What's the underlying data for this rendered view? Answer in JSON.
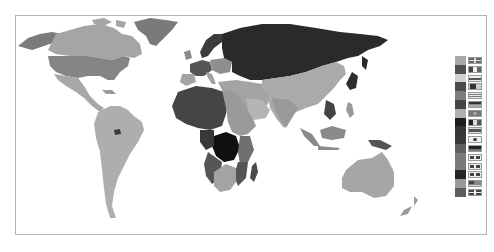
{
  "map": {
    "type": "world-choropleth",
    "palette": "grayscale",
    "regions": [
      {
        "name": "alaska",
        "shade": "#7b7b7b"
      },
      {
        "name": "canada",
        "shade": "#a5a5a5"
      },
      {
        "name": "greenland",
        "shade": "#7a7a7a"
      },
      {
        "name": "usa",
        "shade": "#858585"
      },
      {
        "name": "mexico-central-america",
        "shade": "#a8a8a8"
      },
      {
        "name": "south-america",
        "shade": "#aeaeae"
      },
      {
        "name": "french-guiana",
        "shade": "#3a3a3a"
      },
      {
        "name": "russia",
        "shade": "#2a2a2a"
      },
      {
        "name": "scandinavia",
        "shade": "#3c3c3c"
      },
      {
        "name": "western-europe",
        "shade": "#555555"
      },
      {
        "name": "central-europe",
        "shade": "#8f8f8f"
      },
      {
        "name": "middle-east",
        "shade": "#a4a4a4"
      },
      {
        "name": "west-africa",
        "shade": "#454545"
      },
      {
        "name": "north-east-africa",
        "shade": "#9a9a9a"
      },
      {
        "name": "central-africa",
        "shade": "#101010"
      },
      {
        "name": "southern-africa",
        "shade": "#a3a3a3"
      },
      {
        "name": "angola-mozambique",
        "shade": "#555555"
      },
      {
        "name": "madagascar",
        "shade": "#4a4a4a"
      },
      {
        "name": "asia",
        "shade": "#aaaaaa"
      },
      {
        "name": "indochina",
        "shade": "#444444"
      },
      {
        "name": "indonesia",
        "shade": "#8a8a8a"
      },
      {
        "name": "new-guinea",
        "shade": "#555555"
      },
      {
        "name": "australia",
        "shade": "#a6a6a6"
      },
      {
        "name": "new-zealand",
        "shade": "#9a9a9a"
      }
    ]
  },
  "legend": {
    "items": [
      {
        "swatch": "#a8a8a8",
        "flag": "uk-flag"
      },
      {
        "swatch": "#505050",
        "flag": "vertical-tricolor-flag"
      },
      {
        "swatch": "#d2d2d2",
        "flag": "horizontal-band-flag"
      },
      {
        "swatch": "#4a4a4a",
        "flag": "canton-flag"
      },
      {
        "swatch": "#7d7d7d",
        "flag": "horizontal-stripes-flag"
      },
      {
        "swatch": "#444444",
        "flag": "horizontal-tricolor-flag"
      },
      {
        "swatch": "#b0b0b0",
        "flag": "emblem-flag"
      },
      {
        "swatch": "#1e1e1e",
        "flag": "vertical-tricolor-dark-flag"
      },
      {
        "swatch": "#353535",
        "flag": "horizontal-bicolor-flag"
      },
      {
        "swatch": "#3a3a3a",
        "flag": "circle-flag"
      },
      {
        "swatch": "#606060",
        "flag": "dark-band-flag"
      },
      {
        "swatch": "#7a7a7a",
        "flag": "grid-flag-1"
      },
      {
        "swatch": "#7a7a7a",
        "flag": "grid-flag-2"
      },
      {
        "swatch": "#252525",
        "flag": "grid-flag-3"
      },
      {
        "swatch": "#9a9a9a",
        "flag": "striped-canton-flag"
      },
      {
        "swatch": "#5d5d5d",
        "flag": "cross-flag"
      }
    ]
  }
}
